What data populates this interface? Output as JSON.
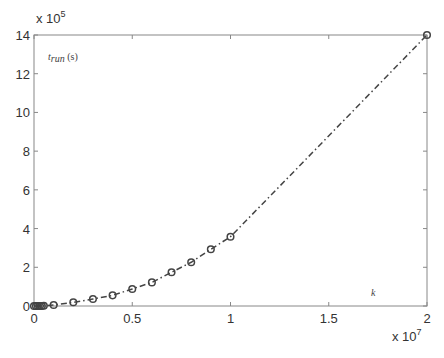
{
  "chart_data": {
    "type": "line",
    "title": "",
    "xlabel": "k",
    "ylabel": "t_run (s)",
    "x_multiplier": "x 10^7",
    "y_multiplier": "x 10^5",
    "xlim": [
      0,
      2
    ],
    "ylim": [
      0,
      14
    ],
    "xticks": [
      "0",
      "0.5",
      "1",
      "1.5",
      "2"
    ],
    "yticks": [
      "0",
      "2",
      "4",
      "6",
      "8",
      "10",
      "12",
      "14"
    ],
    "grid": false,
    "legend": null,
    "series": [
      {
        "name": "t_run",
        "marker": "circle",
        "line_style": "dash-dot",
        "x": [
          0.0,
          0.01,
          0.02,
          0.03,
          0.04,
          0.05,
          0.1,
          0.2,
          0.3,
          0.4,
          0.5,
          0.6,
          0.7,
          0.8,
          0.9,
          1.0,
          2.0
        ],
        "y": [
          0.0,
          0.0,
          0.0,
          0.0,
          0.0,
          0.01,
          0.05,
          0.19,
          0.36,
          0.55,
          0.88,
          1.22,
          1.74,
          2.26,
          2.93,
          3.58,
          14.0
        ]
      }
    ]
  },
  "labels": {
    "y_mult_base": "x 10",
    "y_mult_exp": "5",
    "x_mult_base": "x 10",
    "x_mult_exp": "7",
    "ylabel_t": "t",
    "ylabel_sub": "run",
    "ylabel_unit": " (s)",
    "xlabel": "k"
  }
}
